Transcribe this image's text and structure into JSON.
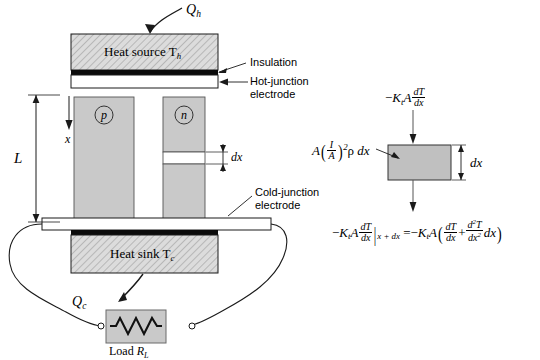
{
  "figure": {
    "colors": {
      "block_fill": "#c9c9c9",
      "hatch_fill": "#d8d8d8",
      "electrode_black": "#0b0b0b",
      "electrode_white": "#ffffff",
      "line": "#1a1a1a",
      "element_box": "#c0c0c0"
    }
  },
  "main_diagram": {
    "heat_source_label": "Heat source T",
    "heat_source_sub": "h",
    "heat_sink_label": "Heat sink T",
    "heat_sink_sub": "c",
    "q_hot_symbol": "Q",
    "q_hot_sub": "h",
    "q_cold_symbol": "Q",
    "q_cold_sub": "c",
    "leg_p_label": "p",
    "leg_n_label": "n",
    "length_label": "L",
    "position_label": "x",
    "dx_label": "dx",
    "callouts": [
      {
        "name": "insulation",
        "text": "Insulation"
      },
      {
        "name": "hot-junction-electrode",
        "line1": "Hot-junction",
        "line2": "electrode"
      },
      {
        "name": "cold-junction-electrode",
        "line1": "Cold-junction",
        "line2": "electrode"
      }
    ],
    "load": {
      "label_prefix": "Load ",
      "label_symbol": "R",
      "label_sub": "L"
    }
  },
  "element_diagram": {
    "dx_label": "dx",
    "top_flux": {
      "sign": "−",
      "conductivity": "K",
      "conductivity_sub": "t",
      "area": "A",
      "frac_num": "dT",
      "frac_den": "dx"
    },
    "joule_term": {
      "area": "A",
      "open_paren": "(",
      "frac_num": "I",
      "frac_den": "A",
      "close_paren": ")",
      "exponent": "2",
      "rho": "ρ",
      "dx": "dx"
    },
    "bottom_flux": {
      "lhs_sign": "−",
      "lhs_conductivity": "K",
      "lhs_conductivity_sub": "t",
      "lhs_area": "A",
      "lhs_frac_num": "dT",
      "lhs_frac_den": "dx",
      "eval_bar": "|",
      "eval_at": "x + dx",
      "equals": "=",
      "rhs_sign": "−",
      "rhs_conductivity": "K",
      "rhs_conductivity_sub": "t",
      "rhs_area": "A",
      "rhs_open": "(",
      "rhs_frac1_num": "dT",
      "rhs_frac1_den": "dx",
      "plus": "+",
      "rhs_frac2_num": "d",
      "rhs_frac2_num_sup": "2",
      "rhs_frac2_num_T": "T",
      "rhs_frac2_den": "dx",
      "rhs_frac2_den_sup": "2",
      "rhs_dx": "dx",
      "rhs_close": ")"
    }
  }
}
